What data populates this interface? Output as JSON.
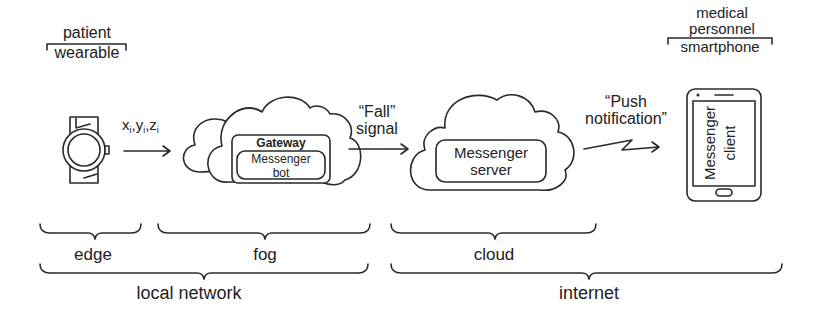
{
  "wearable": {
    "top_label": "patient",
    "bottom_label": "wearable"
  },
  "smartphone": {
    "top_label_1": "medical",
    "top_label_2": "personnel",
    "bottom_label": "smartphone",
    "screen_line1": "Messenger",
    "screen_line2": "client"
  },
  "arrow1": {
    "label": "x",
    "label_y": "y",
    "label_z": "z",
    "sub": "i"
  },
  "fog_cloud": {
    "outer_box": "Gateway",
    "inner_line1": "Messenger",
    "inner_line2": "bot"
  },
  "arrow2": {
    "line1": "“Fall”",
    "line2": "signal"
  },
  "cloud_server": {
    "line1": "Messenger",
    "line2": "server"
  },
  "arrow3": {
    "line1": "“Push",
    "line2": "notification”"
  },
  "braces": {
    "edge": "edge",
    "fog": "fog",
    "cloud": "cloud",
    "local_network": "local network",
    "internet": "internet"
  }
}
